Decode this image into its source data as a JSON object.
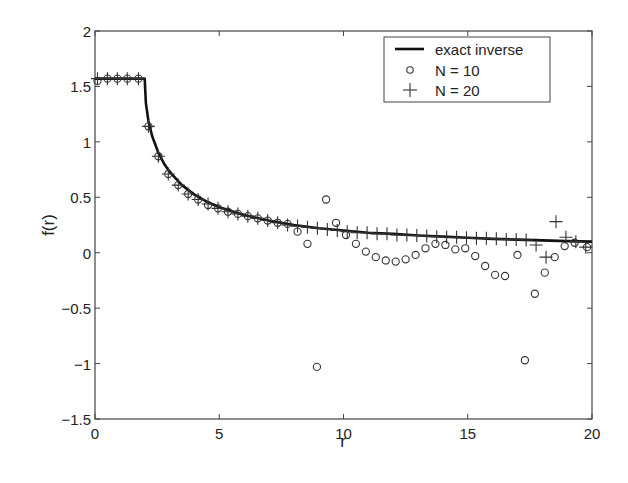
{
  "chart_data": {
    "type": "line",
    "title": "",
    "xlabel": "r",
    "ylabel": "f(r)",
    "xlim": [
      0,
      20
    ],
    "ylim": [
      -1.5,
      2
    ],
    "xticks": [
      0,
      5,
      10,
      15,
      20
    ],
    "xtick_labels": [
      "0",
      "5",
      "10",
      "15",
      "20"
    ],
    "yticks": [
      -1.5,
      -1,
      -0.5,
      0,
      0.5,
      1,
      1.5,
      2
    ],
    "ytick_labels": [
      "−1.5",
      "−1",
      "−0.5",
      "0",
      "0.5",
      "1",
      "1.5",
      "2"
    ],
    "grid": false,
    "legend_position": "upper right",
    "legend": [
      "exact inverse",
      "N = 10",
      "N = 20"
    ],
    "series": [
      {
        "name": "exact inverse",
        "style": "solid-line",
        "x": [
          0,
          0.5,
          1,
          1.5,
          1.8,
          2.0,
          2.05,
          2.15,
          2.3,
          2.55,
          2.8,
          3.0,
          3.5,
          4,
          4.5,
          5,
          6,
          7,
          8,
          9,
          10,
          11,
          12,
          13,
          14,
          15,
          16,
          17,
          18,
          19,
          20
        ],
        "y": [
          1.5708,
          1.5708,
          1.5708,
          1.5708,
          1.5708,
          1.5708,
          1.35,
          1.19,
          1.05,
          0.9,
          0.795,
          0.73,
          0.61,
          0.524,
          0.46,
          0.41,
          0.34,
          0.29,
          0.25,
          0.22,
          0.2,
          0.18,
          0.17,
          0.155,
          0.145,
          0.135,
          0.125,
          0.118,
          0.111,
          0.105,
          0.1
        ]
      },
      {
        "name": "N = 10",
        "style": "circle-markers",
        "x": [
          0.1,
          0.5,
          0.9,
          1.3,
          1.75,
          2.15,
          2.55,
          2.95,
          3.35,
          3.75,
          4.15,
          4.55,
          4.95,
          5.35,
          5.75,
          6.15,
          6.55,
          6.95,
          7.35,
          7.75,
          8.15,
          8.55,
          8.93,
          9.3,
          9.7,
          10.1,
          10.5,
          10.9,
          11.3,
          11.7,
          12.1,
          12.5,
          12.9,
          13.3,
          13.7,
          14.1,
          14.5,
          14.9,
          15.3,
          15.7,
          16.1,
          16.5,
          17.0,
          17.3,
          17.7,
          18.1,
          18.5,
          18.9,
          19.3,
          19.8
        ],
        "y": [
          1.55,
          1.57,
          1.57,
          1.57,
          1.57,
          1.14,
          0.87,
          0.71,
          0.61,
          0.53,
          0.48,
          0.43,
          0.4,
          0.37,
          0.35,
          0.33,
          0.31,
          0.29,
          0.27,
          0.26,
          0.19,
          0.08,
          -1.03,
          0.48,
          0.27,
          0.16,
          0.08,
          0.01,
          -0.04,
          -0.07,
          -0.08,
          -0.06,
          -0.02,
          0.04,
          0.08,
          0.07,
          0.03,
          0.04,
          -0.03,
          -0.12,
          -0.2,
          -0.21,
          -0.02,
          -0.97,
          -0.37,
          -0.18,
          -0.04,
          0.06,
          0.09,
          0.05
        ]
      },
      {
        "name": "N = 20",
        "style": "plus-markers",
        "x": [
          0.1,
          0.5,
          0.9,
          1.3,
          1.75,
          2.15,
          2.55,
          2.95,
          3.35,
          3.75,
          4.15,
          4.55,
          4.95,
          5.35,
          5.75,
          6.15,
          6.55,
          6.95,
          7.35,
          7.75,
          8.15,
          8.55,
          8.95,
          9.35,
          9.75,
          10.15,
          10.55,
          10.95,
          11.35,
          11.75,
          12.15,
          12.55,
          12.95,
          13.35,
          13.75,
          14.15,
          14.55,
          14.95,
          15.35,
          15.75,
          16.15,
          16.55,
          16.95,
          17.35,
          17.75,
          18.15,
          18.55,
          18.95,
          19.35,
          19.75
        ],
        "y": [
          1.57,
          1.57,
          1.57,
          1.57,
          1.57,
          1.14,
          0.87,
          0.71,
          0.61,
          0.53,
          0.48,
          0.44,
          0.4,
          0.37,
          0.35,
          0.33,
          0.31,
          0.29,
          0.27,
          0.25,
          0.24,
          0.23,
          0.22,
          0.21,
          0.2,
          0.19,
          0.18,
          0.18,
          0.17,
          0.17,
          0.16,
          0.16,
          0.155,
          0.15,
          0.145,
          0.14,
          0.14,
          0.135,
          0.13,
          0.13,
          0.125,
          0.12,
          0.12,
          0.115,
          0.07,
          -0.04,
          0.28,
          0.14,
          0.1,
          0.05
        ]
      }
    ]
  }
}
